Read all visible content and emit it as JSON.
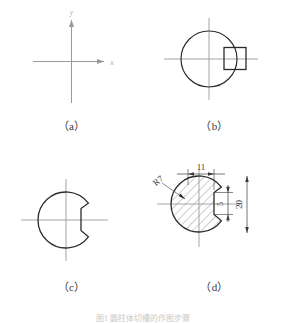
{
  "figure": {
    "caption": "图1  圆柱体切槽的作图步骤",
    "panels": [
      {
        "id": "a",
        "label": "（a）",
        "description": "draw-center-lines",
        "axis_labels": {
          "x": "x",
          "y": "y"
        }
      },
      {
        "id": "b",
        "label": "（b）",
        "description": "draw-circle-and-keyway-square"
      },
      {
        "id": "c",
        "label": "（c）",
        "description": "trim-keyway-notch"
      },
      {
        "id": "d",
        "label": "（d）",
        "description": "section-hatch-and-dimension",
        "dimensions": {
          "radius": "R7",
          "width": "11",
          "height": "20",
          "notch_height": "5"
        }
      }
    ]
  },
  "colors": {
    "outline": "#2b2b2b",
    "centerline": "#9a9a9a",
    "hatch": "#5a5a5a",
    "dimension": "#3a3a3a",
    "caption": "#3a3a3a",
    "background": "#ffffff"
  }
}
